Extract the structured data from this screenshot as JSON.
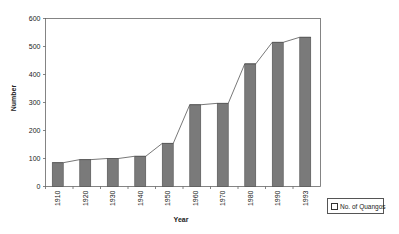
{
  "chart_data": {
    "type": "bar",
    "title": "",
    "xlabel": "Year",
    "ylabel": "Number",
    "ylim": [
      0,
      600
    ],
    "yticks": [
      0,
      100,
      200,
      300,
      400,
      500,
      600
    ],
    "categories": [
      "1910",
      "1920",
      "1930",
      "1940",
      "1950",
      "1960",
      "1970",
      "1980",
      "1990",
      "1993"
    ],
    "series": [
      {
        "name": "No. of Quangos",
        "values": [
          85,
          96,
          100,
          108,
          154,
          292,
          297,
          438,
          515,
          533
        ]
      }
    ],
    "overlay_line": "connects bar tops",
    "grid": false,
    "legend_position": "bottom-right"
  },
  "legend": {
    "label": "No. of Quangos"
  },
  "axes": {
    "x_title": "Year",
    "y_title": "Number"
  },
  "colors": {
    "bar_fill": "#7a7a7a",
    "bar_edge": "#4d4d4d",
    "line": "#555555",
    "axis": "#666666"
  }
}
